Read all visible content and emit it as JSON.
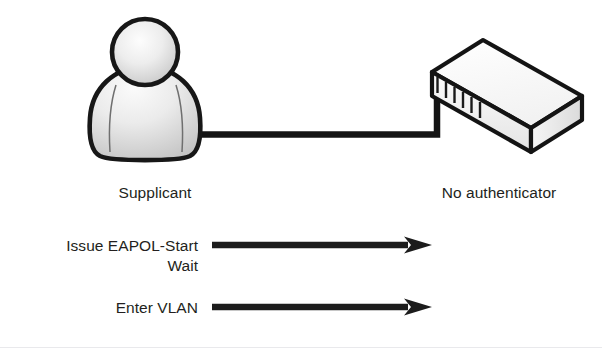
{
  "diagram": {
    "background_color": "#ffffff",
    "ink_color": "#231f20",
    "nodes": [
      {
        "id": "supplicant",
        "icon": "person-icon",
        "label": "Supplicant",
        "label_center_x": 155,
        "label_y": 192
      },
      {
        "id": "authenticator",
        "icon": "network-switch-icon",
        "label": "No authenticator",
        "label_center_x": 499,
        "label_y": 192,
        "port_count": 6
      }
    ],
    "link": {
      "from": "supplicant",
      "to": "authenticator",
      "style": "solid",
      "color": "#000000"
    },
    "messages": [
      {
        "id": "eapol-start",
        "label": "Issue EAPOL-Start",
        "has_arrow": true,
        "direction": "right",
        "arrow_y": 245
      },
      {
        "id": "wait",
        "label": "Wait",
        "has_arrow": false,
        "direction": "",
        "arrow_y": 0
      },
      {
        "id": "enter-vlan",
        "label": "Enter VLAN",
        "has_arrow": true,
        "direction": "right",
        "arrow_y": 307
      }
    ]
  }
}
